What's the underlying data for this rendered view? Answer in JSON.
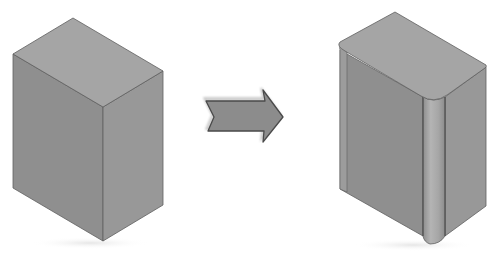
{
  "diagram": {
    "colors": {
      "background": "#ffffff",
      "top_face": "#a4a4a4",
      "left_face": "#8f8f8f",
      "right_face": "#999999",
      "edge": "#5a5a5a",
      "fillet_face": "#a9a9a9",
      "arrow_fill": "#8a8a8a",
      "arrow_stroke": "#4a4a4a",
      "shadow": "#f2f2f2"
    },
    "elements": [
      {
        "id": "box-before",
        "label": "Box with sharp edges"
      },
      {
        "id": "arrow",
        "label": "Transform arrow"
      },
      {
        "id": "box-after",
        "label": "Box with filleted front edge"
      }
    ]
  }
}
